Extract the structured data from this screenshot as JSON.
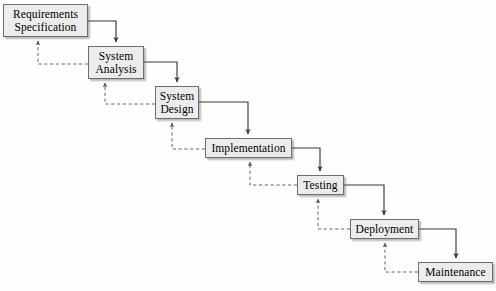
{
  "diagram": {
    "type": "flowchart",
    "background_color": "#fdfdfd",
    "box_fill_color": "#ececec",
    "box_border_color": "#6e6e6e",
    "forward_edge_color": "#3a3a3a",
    "feedback_edge_color": "#666666",
    "feedback_edge_style": "dashed",
    "nodes": [
      {
        "id": "requirements-specification",
        "label": "Requirements\nSpecification",
        "x": 3,
        "y": 4,
        "width": 85,
        "height": 33
      },
      {
        "id": "system-analysis",
        "label": "System\nAnalysis",
        "x": 88,
        "y": 46,
        "width": 56,
        "height": 33
      },
      {
        "id": "system-design",
        "label": "System\nDesign",
        "x": 155,
        "y": 86,
        "width": 44,
        "height": 33
      },
      {
        "id": "implementation",
        "label": "Implementation",
        "x": 205,
        "y": 138,
        "width": 87,
        "height": 20
      },
      {
        "id": "testing",
        "label": "Testing",
        "x": 297,
        "y": 175,
        "width": 47,
        "height": 20
      },
      {
        "id": "deployment",
        "label": "Deployment",
        "x": 350,
        "y": 219,
        "width": 69,
        "height": 20
      },
      {
        "id": "maintenance",
        "label": "Maintenance",
        "x": 418,
        "y": 262,
        "width": 75,
        "height": 20
      }
    ],
    "forward_edges": [
      {
        "from": "requirements-specification",
        "to": "system-analysis"
      },
      {
        "from": "system-analysis",
        "to": "system-design"
      },
      {
        "from": "system-design",
        "to": "implementation"
      },
      {
        "from": "implementation",
        "to": "testing"
      },
      {
        "from": "testing",
        "to": "deployment"
      },
      {
        "from": "deployment",
        "to": "maintenance"
      }
    ],
    "feedback_edges": [
      {
        "from": "system-analysis",
        "to": "requirements-specification"
      },
      {
        "from": "system-design",
        "to": "system-analysis"
      },
      {
        "from": "implementation",
        "to": "system-design"
      },
      {
        "from": "testing",
        "to": "implementation"
      },
      {
        "from": "deployment",
        "to": "testing"
      },
      {
        "from": "maintenance",
        "to": "deployment"
      }
    ]
  }
}
